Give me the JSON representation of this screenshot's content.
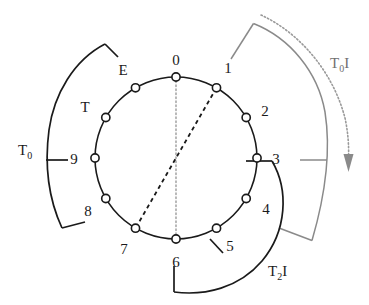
{
  "figure": {
    "center": {
      "x": 176,
      "y": 158
    },
    "radius": 81,
    "colors": {
      "stroke_black": "#1a1a1a",
      "stroke_gray": "#8a8a8a",
      "dotted_gray": "#9a9a9a",
      "background": "#ffffff"
    }
  },
  "clock": {
    "node_count": 12,
    "nodes": [
      {
        "id": "pc-0",
        "label": "0",
        "hour": 0,
        "label_dx": 0,
        "label_dy": -17
      },
      {
        "id": "pc-1",
        "label": "1",
        "hour": 1,
        "label_dx": 16,
        "label_dy": -12
      },
      {
        "id": "pc-2",
        "label": "2",
        "hour": 2,
        "label_dx": 21,
        "label_dy": -5
      },
      {
        "id": "pc-3",
        "label": "3",
        "hour": 3,
        "label_dx": 22,
        "label_dy": 5
      },
      {
        "id": "pc-4",
        "label": "4",
        "hour": 4,
        "label_dx": 21,
        "label_dy": 14
      },
      {
        "id": "pc-5",
        "label": "5",
        "hour": 5,
        "label_dx": 16,
        "label_dy": 19
      },
      {
        "id": "pc-6",
        "label": "6",
        "hour": 6,
        "label_dx": 0,
        "label_dy": 22
      },
      {
        "id": "pc-7",
        "label": "7",
        "hour": 7,
        "label_dx": -16,
        "label_dy": 20
      },
      {
        "id": "pc-8",
        "label": "8",
        "hour": 8,
        "label_dx": -21,
        "label_dy": 13
      },
      {
        "id": "pc-9",
        "label": "9",
        "hour": 9,
        "label_dx": -22,
        "label_dy": 5
      },
      {
        "id": "pc-10",
        "label": "T",
        "hour": 10,
        "label_dx": -22,
        "label_dy": -6
      },
      {
        "id": "pc-11",
        "label": "E",
        "hour": 11,
        "label_dx": -15,
        "label_dy": -14
      }
    ]
  },
  "chords": [
    {
      "id": "axis-0-6",
      "style": "dotted",
      "from_hour": 0,
      "to_hour": 6,
      "color": "#9a9a9a"
    },
    {
      "id": "axis-1-7",
      "style": "dashed",
      "from_hour": 1,
      "to_hour": 7,
      "color": "#1a1a1a"
    }
  ],
  "brackets": [
    {
      "id": "bracket-t0",
      "label": "T0",
      "label_main": "T",
      "label_sub": "0",
      "color": "black",
      "side": "left",
      "span_hours": [
        11,
        8
      ],
      "tick_hour": 9,
      "label_pos": {
        "x": 18,
        "y": 155
      }
    },
    {
      "id": "bracket-t0i",
      "label": "T0I",
      "label_main": "T",
      "label_sub": "0",
      "label_tail": "I",
      "color": "gray",
      "side": "right-outer",
      "span_hours": [
        1,
        5
      ],
      "tick_hour": 3,
      "label_pos": {
        "x": 330,
        "y": 68
      }
    },
    {
      "id": "bracket-t2i",
      "label": "T2I",
      "label_main": "T",
      "label_sub": "2",
      "label_tail": "I",
      "color": "black",
      "side": "right-inner",
      "span_hours": [
        3,
        6
      ],
      "tick_hour": 5,
      "label_pos": {
        "x": 268,
        "y": 276
      }
    }
  ],
  "arrow": {
    "id": "rotation-arrow",
    "style": "dotted",
    "direction": "clockwise-downward",
    "color": "#9a9a9a"
  }
}
